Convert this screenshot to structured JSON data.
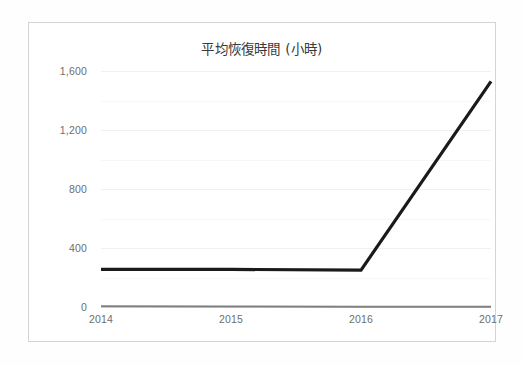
{
  "chart_data": {
    "type": "line",
    "title": "平均恢復時間 (小時)",
    "xlabel": "",
    "ylabel": "",
    "categories": [
      "2014",
      "2015",
      "2016",
      "2017"
    ],
    "x": [
      2014,
      2015,
      2016,
      2017
    ],
    "series": [
      {
        "name": "series-1",
        "color": "#1a1a1a",
        "width": 3.2,
        "values": [
          255,
          255,
          250,
          1530
        ]
      },
      {
        "name": "series-2",
        "color": "#808080",
        "width": 2.0,
        "values": [
          5,
          3,
          2,
          2
        ]
      }
    ],
    "ylim": [
      0,
      1600
    ],
    "yticks": [
      0,
      400,
      800,
      1200,
      1600
    ],
    "ytick_labels": [
      "0",
      "400",
      "800",
      "1,200",
      "1,600"
    ],
    "minor_yticks": [
      200,
      600,
      1000,
      1400
    ],
    "grid": true,
    "grid_axis": "y",
    "legend": false,
    "legend_position": "none",
    "frame_color": "#d4d4d4",
    "background": "#ffffff",
    "tick_color": "#6e6e6e",
    "gridline_color": "#f0f0f0"
  }
}
